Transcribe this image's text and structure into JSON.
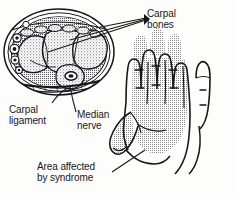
{
  "figure": {
    "background_color": "#fdfdfc",
    "ink_color": "#17171a",
    "stipple_color": "#6f6f72"
  },
  "labels": {
    "carpal_bones": "Carpal\nbones",
    "carpal_ligament": "Carpal\nligament",
    "median_nerve": "Median\nnerve",
    "area_affected": "Area affected\nby syndrome"
  },
  "diagram_parts": {
    "cross_section": "wrist-cross-section",
    "hand": "palm-view-hand",
    "shaded_region": "median-nerve-distribution"
  }
}
